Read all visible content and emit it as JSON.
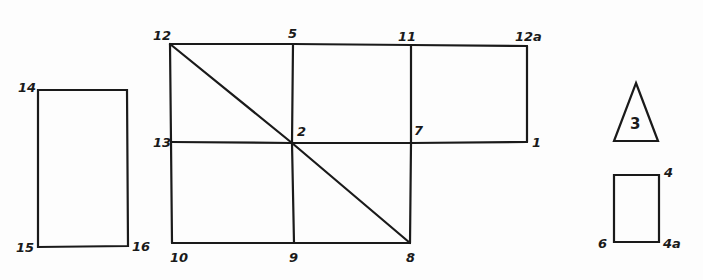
{
  "diagram": {
    "type": "hand-drawn floor-plan / layout sketch with numbered corners",
    "main_grid": {
      "points": {
        "12": {
          "label": "12",
          "x": 170,
          "y": 44
        },
        "5": {
          "label": "5",
          "x": 293,
          "y": 44
        },
        "11": {
          "label": "11",
          "x": 411,
          "y": 45
        },
        "12a": {
          "label": "12a",
          "x": 527,
          "y": 46
        },
        "13": {
          "label": "13",
          "x": 171,
          "y": 142
        },
        "2": {
          "label": "2",
          "x": 292,
          "y": 143
        },
        "7": {
          "label": "7",
          "x": 411,
          "y": 143
        },
        "1": {
          "label": "1",
          "x": 527,
          "y": 142
        },
        "10": {
          "label": "10",
          "x": 172,
          "y": 243
        },
        "9": {
          "label": "9",
          "x": 294,
          "y": 243
        },
        "8": {
          "label": "8",
          "x": 410,
          "y": 243
        }
      },
      "edges": [
        [
          "12",
          "5"
        ],
        [
          "5",
          "11"
        ],
        [
          "11",
          "12a"
        ],
        [
          "13",
          "2"
        ],
        [
          "2",
          "7"
        ],
        [
          "7",
          "1"
        ],
        [
          "10",
          "9"
        ],
        [
          "9",
          "8"
        ],
        [
          "12",
          "13"
        ],
        [
          "13",
          "10"
        ],
        [
          "5",
          "2"
        ],
        [
          "2",
          "9"
        ],
        [
          "11",
          "7"
        ],
        [
          "7",
          "8"
        ],
        [
          "12a",
          "1"
        ],
        [
          "12",
          "2"
        ],
        [
          "2",
          "8"
        ]
      ]
    },
    "left_rectangle": {
      "points": {
        "14": {
          "label": "14",
          "x": 38,
          "y": 90
        },
        "14r": {
          "label": "",
          "x": 127,
          "y": 90
        },
        "16": {
          "label": "16",
          "x": 128,
          "y": 246
        },
        "15": {
          "label": "15",
          "x": 38,
          "y": 247
        }
      }
    },
    "triangle": {
      "label": "3",
      "apex": {
        "x": 636,
        "y": 83
      },
      "base_left": {
        "x": 614,
        "y": 141
      },
      "base_right": {
        "x": 658,
        "y": 141
      }
    },
    "small_rectangle": {
      "points": {
        "4": {
          "label": "4",
          "x": 659,
          "y": 175
        },
        "4a": {
          "label": "4a",
          "x": 659,
          "y": 242
        },
        "6": {
          "label": "6",
          "x": 614,
          "y": 242
        },
        "tl": {
          "label": "",
          "x": 614,
          "y": 175
        }
      }
    },
    "labels": [
      {
        "id": "12",
        "text": "12",
        "x": 153,
        "y": 40
      },
      {
        "id": "5",
        "text": "5",
        "x": 288,
        "y": 38
      },
      {
        "id": "11",
        "text": "11",
        "x": 398,
        "y": 41
      },
      {
        "id": "12a",
        "text": "12a",
        "x": 515,
        "y": 41
      },
      {
        "id": "13",
        "text": "13",
        "x": 153,
        "y": 147
      },
      {
        "id": "2",
        "text": "2",
        "x": 297,
        "y": 136
      },
      {
        "id": "7",
        "text": "7",
        "x": 414,
        "y": 135
      },
      {
        "id": "1",
        "text": "1",
        "x": 532,
        "y": 147
      },
      {
        "id": "10",
        "text": "10",
        "x": 170,
        "y": 262
      },
      {
        "id": "9",
        "text": "9",
        "x": 289,
        "y": 262
      },
      {
        "id": "8",
        "text": "8",
        "x": 406,
        "y": 262
      },
      {
        "id": "14",
        "text": "14",
        "x": 18,
        "y": 92
      },
      {
        "id": "15",
        "text": "15",
        "x": 16,
        "y": 252
      },
      {
        "id": "16",
        "text": "16",
        "x": 132,
        "y": 251
      },
      {
        "id": "3",
        "text": "3",
        "x": 630,
        "y": 129
      },
      {
        "id": "4",
        "text": "4",
        "x": 664,
        "y": 177
      },
      {
        "id": "6",
        "text": "6",
        "x": 598,
        "y": 248
      },
      {
        "id": "4a",
        "text": "4a",
        "x": 663,
        "y": 248
      }
    ]
  }
}
